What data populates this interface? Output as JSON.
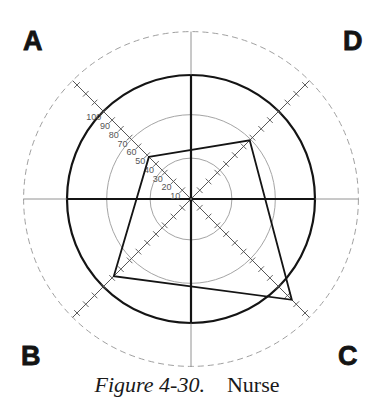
{
  "figure": {
    "caption_number": "Figure 4-30.",
    "caption_title": "Nurse"
  },
  "corners": {
    "top_left": "A",
    "top_right": "D",
    "bottom_left": "B",
    "bottom_right": "C"
  },
  "axis_tick_labels": [
    "10",
    "20",
    "30",
    "40",
    "50",
    "60",
    "70",
    "80",
    "90",
    "100"
  ],
  "colors": {
    "ink": "#141414",
    "thin_ring": "#9a9a9a",
    "dashed_ring": "#a0a0a0",
    "axis": "#555555"
  },
  "chart_data": {
    "type": "radar",
    "title": "Figure 4-30. Nurse",
    "axes": [
      "A",
      "D",
      "C",
      "B"
    ],
    "axis_directions": {
      "A": "upper-left",
      "D": "upper-right",
      "C": "lower-right",
      "B": "lower-left"
    },
    "scale": {
      "min": 0,
      "max": 135,
      "tick_step": 10,
      "labeled_ticks": [
        10,
        20,
        30,
        40,
        50,
        60,
        70,
        80,
        90,
        100
      ]
    },
    "reference_rings": [
      {
        "value": 33,
        "style": "thin"
      },
      {
        "value": 68,
        "style": "thin"
      },
      {
        "value": 100,
        "style": "thick"
      },
      {
        "value": 135,
        "style": "dashed"
      }
    ],
    "series": [
      {
        "name": "Nurse",
        "values": {
          "A": 48,
          "D": 67,
          "C": 115,
          "B": 88
        }
      }
    ],
    "grid": true,
    "legend": null
  }
}
